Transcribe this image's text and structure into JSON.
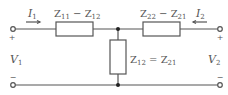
{
  "diagram": {
    "type": "two-port T-equivalent circuit",
    "colors": {
      "wire": "#555555",
      "text": "#555555",
      "background": "#ffffff"
    },
    "currents": {
      "left": {
        "symbol": "I",
        "sub": "1",
        "direction": "right"
      },
      "right": {
        "symbol": "I",
        "sub": "2",
        "direction": "left"
      }
    },
    "voltages": {
      "left": {
        "symbol": "V",
        "sub": "1",
        "plus": "+",
        "minus": "−"
      },
      "right": {
        "symbol": "V",
        "sub": "2",
        "plus": "+",
        "minus": "−"
      }
    },
    "impedances": {
      "series_left": {
        "a": "Z",
        "a_sub": "11",
        "op": " − ",
        "b": "Z",
        "b_sub": "12"
      },
      "series_right": {
        "a": "Z",
        "a_sub": "22",
        "op": " − ",
        "b": "Z",
        "b_sub": "21"
      },
      "shunt": {
        "a": "Z",
        "a_sub": "12",
        "op": " = ",
        "b": "Z",
        "b_sub": "21"
      }
    }
  }
}
